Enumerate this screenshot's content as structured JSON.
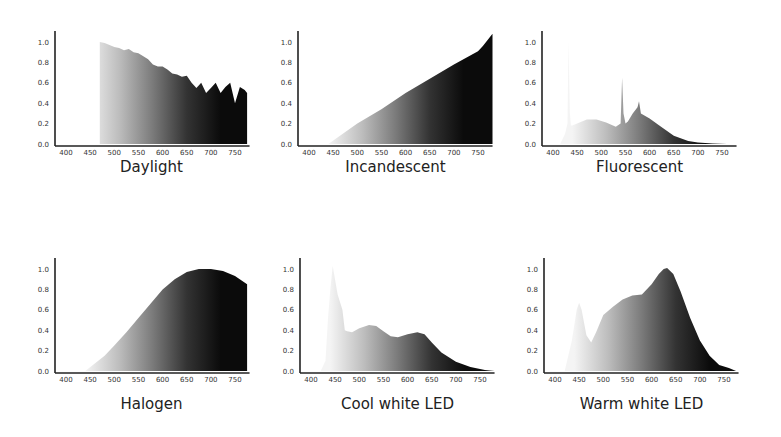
{
  "chart_data": [
    {
      "type": "area",
      "title": "Daylight",
      "xlabel": "",
      "ylabel": "",
      "x_ticks": [
        400,
        450,
        500,
        550,
        600,
        650,
        700,
        750
      ],
      "y_ticks": [
        "0.0",
        "0.2",
        "0.4",
        "0.6",
        "0.8",
        "1.0"
      ],
      "xlim": [
        380,
        780
      ],
      "ylim": [
        0,
        1.0
      ],
      "x": [
        470,
        480,
        490,
        500,
        510,
        520,
        530,
        540,
        550,
        560,
        570,
        580,
        590,
        600,
        610,
        620,
        630,
        640,
        650,
        660,
        670,
        680,
        690,
        700,
        710,
        720,
        730,
        740,
        750,
        760,
        770,
        775
      ],
      "y": [
        1.0,
        0.99,
        0.97,
        0.95,
        0.94,
        0.92,
        0.93,
        0.9,
        0.89,
        0.86,
        0.83,
        0.78,
        0.76,
        0.76,
        0.73,
        0.69,
        0.68,
        0.66,
        0.67,
        0.6,
        0.55,
        0.6,
        0.5,
        0.55,
        0.6,
        0.5,
        0.56,
        0.6,
        0.4,
        0.56,
        0.53,
        0.5
      ],
      "grid": false,
      "fill": "wavelength gradient white to black"
    },
    {
      "type": "area",
      "title": "Incandescent",
      "xlabel": "",
      "ylabel": "",
      "x_ticks": [
        400,
        450,
        500,
        550,
        600,
        650,
        700,
        750
      ],
      "y_ticks": [
        "0.0",
        "0.2",
        "0.4",
        "0.6",
        "0.8",
        "1.0"
      ],
      "xlim": [
        380,
        780
      ],
      "ylim": [
        0,
        1.0
      ],
      "x": [
        440,
        500,
        550,
        600,
        650,
        700,
        750,
        760,
        780
      ],
      "y": [
        0.0,
        0.2,
        0.34,
        0.5,
        0.64,
        0.78,
        0.91,
        0.96,
        1.08
      ],
      "grid": false,
      "fill": "wavelength gradient white to black"
    },
    {
      "type": "area",
      "title": "Fluorescent",
      "xlabel": "",
      "ylabel": "",
      "x_ticks": [
        400,
        450,
        500,
        550,
        600,
        650,
        700,
        750
      ],
      "y_ticks": [
        "0.0",
        "0.2",
        "0.4",
        "0.6",
        "0.8",
        "1.0"
      ],
      "xlim": [
        380,
        780
      ],
      "ylim": [
        0,
        1.0
      ],
      "x": [
        415,
        425,
        430,
        432,
        435,
        437,
        440,
        450,
        470,
        490,
        510,
        530,
        540,
        543,
        546,
        550,
        555,
        565,
        575,
        578,
        582,
        600,
        620,
        650,
        680,
        700,
        730,
        760
      ],
      "y": [
        0.0,
        0.1,
        0.2,
        1.0,
        0.3,
        0.18,
        0.18,
        0.2,
        0.24,
        0.24,
        0.21,
        0.17,
        0.2,
        0.65,
        0.3,
        0.2,
        0.22,
        0.3,
        0.36,
        0.42,
        0.3,
        0.25,
        0.18,
        0.08,
        0.03,
        0.015,
        0.005,
        0.0
      ],
      "grid": false,
      "fill": "wavelength gradient white to black"
    },
    {
      "type": "area",
      "title": "Halogen",
      "xlabel": "",
      "ylabel": "",
      "x_ticks": [
        400,
        450,
        500,
        550,
        600,
        650,
        700,
        750
      ],
      "y_ticks": [
        "0.0",
        "0.2",
        "0.4",
        "0.6",
        "0.8",
        "1.0"
      ],
      "xlim": [
        380,
        780
      ],
      "ylim": [
        0,
        1.0
      ],
      "x": [
        440,
        480,
        500,
        525,
        550,
        575,
        600,
        625,
        650,
        675,
        700,
        725,
        750,
        775
      ],
      "y": [
        0.0,
        0.15,
        0.25,
        0.38,
        0.52,
        0.66,
        0.8,
        0.9,
        0.97,
        1.0,
        1.0,
        0.98,
        0.93,
        0.85
      ],
      "grid": false,
      "fill": "wavelength gradient white to black"
    },
    {
      "type": "area",
      "title": "Cool white LED",
      "xlabel": "",
      "ylabel": "",
      "x_ticks": [
        400,
        450,
        500,
        550,
        600,
        650,
        700,
        750
      ],
      "y_ticks": [
        "0.0",
        "0.2",
        "0.4",
        "0.6",
        "0.8",
        "1.0"
      ],
      "xlim": [
        380,
        780
      ],
      "ylim": [
        0,
        1.0
      ],
      "x": [
        420,
        430,
        435,
        440,
        445,
        455,
        465,
        470,
        475,
        485,
        500,
        520,
        535,
        550,
        565,
        580,
        600,
        620,
        635,
        650,
        670,
        700,
        730,
        760,
        780
      ],
      "y": [
        0.0,
        0.1,
        0.5,
        0.8,
        1.03,
        0.75,
        0.6,
        0.4,
        0.39,
        0.38,
        0.42,
        0.45,
        0.44,
        0.39,
        0.34,
        0.33,
        0.36,
        0.38,
        0.36,
        0.28,
        0.18,
        0.09,
        0.04,
        0.01,
        0.0
      ],
      "grid": false,
      "fill": "wavelength gradient white to black"
    },
    {
      "type": "area",
      "title": "Warm white LED",
      "xlabel": "",
      "ylabel": "",
      "x_ticks": [
        400,
        450,
        500,
        550,
        600,
        650,
        700,
        750
      ],
      "y_ticks": [
        "0.0",
        "0.2",
        "0.4",
        "0.6",
        "0.8",
        "1.0"
      ],
      "xlim": [
        380,
        780
      ],
      "ylim": [
        0,
        1.0
      ],
      "x": [
        420,
        435,
        445,
        450,
        455,
        465,
        475,
        485,
        500,
        520,
        540,
        560,
        580,
        600,
        615,
        625,
        632,
        645,
        660,
        680,
        700,
        720,
        740,
        760,
        775
      ],
      "y": [
        0.0,
        0.3,
        0.6,
        0.67,
        0.6,
        0.35,
        0.28,
        0.38,
        0.55,
        0.63,
        0.7,
        0.74,
        0.75,
        0.85,
        0.95,
        1.0,
        1.01,
        0.95,
        0.78,
        0.52,
        0.3,
        0.15,
        0.06,
        0.03,
        0.0
      ],
      "grid": false,
      "fill": "wavelength gradient white to black"
    }
  ],
  "panels": [
    {
      "title": "Daylight"
    },
    {
      "title": "Incandescent"
    },
    {
      "title": "Fluorescent"
    },
    {
      "title": "Halogen"
    },
    {
      "title": "Cool white LED"
    },
    {
      "title": "Warm white LED"
    }
  ]
}
